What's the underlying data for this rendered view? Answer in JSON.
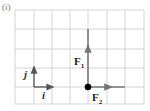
{
  "figure": {
    "part_label": "(i)",
    "grid": {
      "x0": 15,
      "y0": 10,
      "cols": 7,
      "rows": 5,
      "cell_w": 18.4,
      "cell_h": 18.8,
      "line_color": "#d4d4d4"
    },
    "vectors": {
      "F1": {
        "label": "F",
        "sub": "1",
        "color": "#777777"
      },
      "F2": {
        "label": "F",
        "sub": "2",
        "color": "#777777"
      }
    },
    "unit_vectors": {
      "i": {
        "label": "i"
      },
      "j": {
        "label": "j"
      }
    },
    "origin_point": {
      "color": "#000000"
    }
  }
}
